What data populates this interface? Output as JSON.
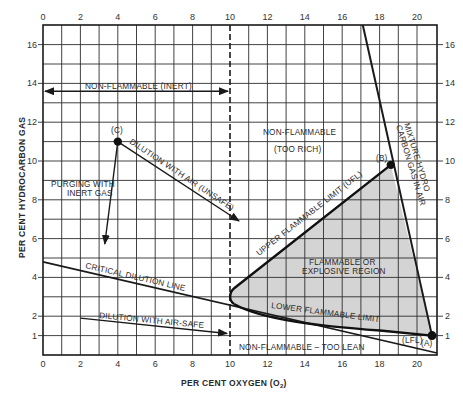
{
  "chart_data": {
    "type": "diagram",
    "xlabel": "PER CENT OXYGEN (O2)",
    "ylabel": "PER CENT HYDROCARBON GAS",
    "xlim": [
      0,
      21
    ],
    "ylim": [
      0,
      17
    ],
    "x_ticks": [
      "0",
      "2",
      "4",
      "6",
      "8",
      "10",
      "12",
      "14",
      "16",
      "18",
      "20"
    ],
    "y_ticks": [
      "1",
      "2",
      "4",
      "6",
      "8",
      "10",
      "12",
      "14",
      "16"
    ],
    "grid": true,
    "points": [
      {
        "label": "(A)",
        "x": 20.8,
        "y": 1.0
      },
      {
        "label": "(B)",
        "x": 18.6,
        "y": 9.8
      },
      {
        "label": "(C)",
        "x": 4.0,
        "y": 11.0
      }
    ],
    "lines": [
      {
        "name": "Mixture hydrocarbon gas in air",
        "from": [
          17.1,
          17
        ],
        "to": [
          20.8,
          1.0
        ]
      },
      {
        "name": "Critical dilution line",
        "from": [
          0,
          4.8
        ],
        "to": [
          20.9,
          0.1
        ]
      },
      {
        "name": "Upper flammable limit (UFL)",
        "from": [
          18.6,
          9.8
        ],
        "to": [
          10,
          3.2
        ]
      },
      {
        "name": "Lower flammable limit (LFL)",
        "from": [
          10,
          3.2
        ],
        "to": [
          20.8,
          1.0
        ]
      },
      {
        "name": "10% oxygen boundary (dashed)",
        "from": [
          10,
          0
        ],
        "to": [
          10,
          17
        ]
      }
    ],
    "arrows": [
      {
        "name": "Non-flammable (inert)",
        "from": [
          0,
          13.6
        ],
        "to": [
          10,
          13.6
        ],
        "double": true
      },
      {
        "name": "Purging with inert gas",
        "from": [
          4.0,
          11.0
        ],
        "to": [
          3.3,
          5.7
        ]
      },
      {
        "name": "Dilution with air (unsafe)",
        "from": [
          4.0,
          11.0
        ],
        "to": [
          10.0,
          7.0
        ]
      },
      {
        "name": "Dilution with air - safe",
        "from": [
          2.0,
          1.9
        ],
        "to": [
          9.8,
          1.1
        ]
      }
    ],
    "regions": [
      {
        "name": "Flammable or explosive region",
        "bounded_by": [
          "UFL",
          "LFL",
          "air line"
        ],
        "fill": "#d3d3d3"
      },
      {
        "name": "Non-flammable (too rich)"
      },
      {
        "name": "Non-flammable - too lean"
      },
      {
        "name": "Non-flammable (inert)"
      }
    ]
  },
  "axes": {
    "x_title": "PER CENT OXYGEN (O",
    "x_title_sub": "2",
    "x_title_end": ")",
    "y_title": "PER CENT HYDROCARBON GAS",
    "top_ticks": [
      "0",
      "2",
      "4",
      "6",
      "8",
      "10",
      "12",
      "14",
      "16",
      "18",
      "20"
    ],
    "bottom_ticks": [
      "0",
      "2",
      "4",
      "6",
      "8",
      "10",
      "12",
      "14",
      "16",
      "18",
      "20"
    ],
    "left_ticks": [
      "1",
      "2",
      "4",
      "6",
      "8",
      "10",
      "12",
      "14",
      "16"
    ],
    "right_ticks": [
      "1",
      "2",
      "4",
      "6",
      "8",
      "10",
      "12",
      "14",
      "16"
    ]
  },
  "labels": {
    "inert": "NON-FLAMMABLE (INERT)",
    "too_rich_1": "NON-FLAMMABLE",
    "too_rich_2": "(TOO RICH)",
    "purging_1": "PURGING WITH",
    "purging_2": "INERT GAS",
    "unsafe": "DILUTION WITH AIR (UNSAFE)",
    "critical": "CRITICAL DILUTION LINE",
    "safe": "DILUTION WITH AIR-SAFE",
    "ufl": "UPPER FLAMMABLE LIMIT (UFL)",
    "lfl_line": "LOWER FLAMMABLE LIMIT",
    "lfl_short": "(LFL)",
    "flammable_1": "FLAMMABLE OR",
    "flammable_2": "EXPLOSIVE REGION",
    "too_lean": "NON-FLAMMABLE – TOO LEAN",
    "mixture_1": "MIXTURE HYDRO",
    "mixture_2": "CARBON GAS IN AIR",
    "point_a": "(A)",
    "point_b": "(B)",
    "point_c": "(C)"
  },
  "colors": {
    "ink": "#1a1a1a",
    "grid": "#2e2e2e",
    "flammable_fill": "#d4d4d4",
    "background": "#ffffff"
  }
}
